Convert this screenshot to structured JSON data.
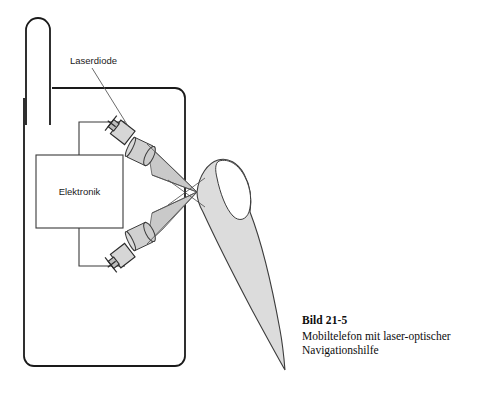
{
  "figure": {
    "domain": "technical-diagram",
    "background_color": "#ffffff",
    "stroke_color": "#1a1a1a",
    "beam_fill_color": "#c9c9c9",
    "finger_fill_color": "#dcdcdc",
    "lens_fill_color": "#d0d0d0",
    "diode_fill_color": "#d6d6d6",
    "labels": {
      "laserdiode": "Laserdiode",
      "elektronik": "Elektronik"
    },
    "components": [
      {
        "name": "antenna",
        "label": ""
      },
      {
        "name": "phone-body",
        "label": ""
      },
      {
        "name": "electronics-box",
        "label": "Elektronik"
      },
      {
        "name": "laser-diode-upper",
        "label": "Laserdiode"
      },
      {
        "name": "laser-diode-lower",
        "label": ""
      },
      {
        "name": "lens-upper",
        "label": ""
      },
      {
        "name": "lens-lower",
        "label": ""
      },
      {
        "name": "laser-beam-upper",
        "label": ""
      },
      {
        "name": "laser-beam-lower",
        "label": ""
      },
      {
        "name": "finger",
        "label": ""
      }
    ]
  },
  "caption": {
    "title": "Bild 21-5",
    "lines": [
      "Mobiltelefon mit laser-optischer",
      "Navigationshilfe"
    ],
    "line1": "Mobiltelefon mit laser-optischer",
    "line2": "Navigationshilfe"
  }
}
